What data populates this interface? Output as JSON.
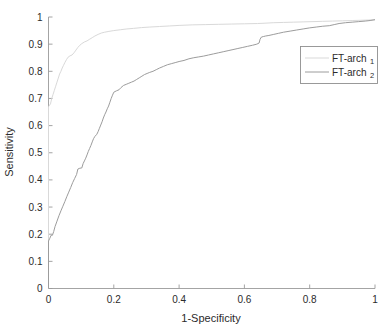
{
  "chart_data": {
    "type": "line",
    "title": "",
    "subtitle": "",
    "xlabel": "1-Specificity",
    "ylabel": "Sensitivity",
    "xlim": [
      0,
      1
    ],
    "ylim": [
      0,
      1
    ],
    "grid": false,
    "legend_position": "right",
    "x_ticks": [
      "0",
      "0.2",
      "0.4",
      "0.6",
      "0.8",
      "1"
    ],
    "x_tick_values": [
      0,
      0.2,
      0.4,
      0.6,
      0.8,
      1
    ],
    "y_ticks": [
      "0",
      "0.1",
      "0.2",
      "0.3",
      "0.4",
      "0.5",
      "0.6",
      "0.7",
      "0.8",
      "0.9",
      "1"
    ],
    "y_tick_values": [
      0,
      0.1,
      0.2,
      0.3,
      0.4,
      0.5,
      0.6,
      0.7,
      0.8,
      0.9,
      1
    ],
    "series": [
      {
        "name": "FT-arch",
        "subscript": "1",
        "color": "#d9d9d9",
        "points": [
          [
            0.0,
            0.0
          ],
          [
            0.0,
            0.67
          ],
          [
            0.006,
            0.68
          ],
          [
            0.01,
            0.7
          ],
          [
            0.014,
            0.715
          ],
          [
            0.018,
            0.73
          ],
          [
            0.022,
            0.745
          ],
          [
            0.026,
            0.76
          ],
          [
            0.03,
            0.775
          ],
          [
            0.034,
            0.79
          ],
          [
            0.038,
            0.8
          ],
          [
            0.042,
            0.812
          ],
          [
            0.046,
            0.822
          ],
          [
            0.05,
            0.832
          ],
          [
            0.055,
            0.843
          ],
          [
            0.06,
            0.852
          ],
          [
            0.066,
            0.857
          ],
          [
            0.072,
            0.86
          ],
          [
            0.078,
            0.868
          ],
          [
            0.084,
            0.878
          ],
          [
            0.09,
            0.888
          ],
          [
            0.096,
            0.896
          ],
          [
            0.102,
            0.902
          ],
          [
            0.11,
            0.908
          ],
          [
            0.118,
            0.912
          ],
          [
            0.126,
            0.918
          ],
          [
            0.134,
            0.924
          ],
          [
            0.142,
            0.93
          ],
          [
            0.152,
            0.936
          ],
          [
            0.162,
            0.941
          ],
          [
            0.172,
            0.944
          ],
          [
            0.185,
            0.947
          ],
          [
            0.2,
            0.95
          ],
          [
            0.22,
            0.953
          ],
          [
            0.24,
            0.956
          ],
          [
            0.26,
            0.958
          ],
          [
            0.285,
            0.961
          ],
          [
            0.31,
            0.963
          ],
          [
            0.34,
            0.965
          ],
          [
            0.37,
            0.967
          ],
          [
            0.4,
            0.969
          ],
          [
            0.44,
            0.971
          ],
          [
            0.48,
            0.972
          ],
          [
            0.52,
            0.973
          ],
          [
            0.56,
            0.974
          ],
          [
            0.6,
            0.975
          ],
          [
            0.64,
            0.976
          ],
          [
            0.66,
            0.977
          ],
          [
            0.69,
            0.979
          ],
          [
            0.72,
            0.98
          ],
          [
            0.75,
            0.981
          ],
          [
            0.78,
            0.982
          ],
          [
            0.81,
            0.983
          ],
          [
            0.84,
            0.984
          ],
          [
            0.87,
            0.985
          ],
          [
            0.9,
            0.986
          ],
          [
            0.93,
            0.987
          ],
          [
            0.96,
            0.988
          ],
          [
            0.98,
            0.989
          ],
          [
            1.0,
            0.99
          ]
        ]
      },
      {
        "name": "FT-arch",
        "subscript": "2",
        "color": "#9c9c9c",
        "points": [
          [
            0.0,
            0.0
          ],
          [
            0.0,
            0.175
          ],
          [
            0.004,
            0.185
          ],
          [
            0.008,
            0.196
          ],
          [
            0.012,
            0.196
          ],
          [
            0.016,
            0.21
          ],
          [
            0.02,
            0.228
          ],
          [
            0.026,
            0.248
          ],
          [
            0.032,
            0.268
          ],
          [
            0.038,
            0.286
          ],
          [
            0.044,
            0.303
          ],
          [
            0.05,
            0.32
          ],
          [
            0.056,
            0.338
          ],
          [
            0.062,
            0.355
          ],
          [
            0.068,
            0.372
          ],
          [
            0.074,
            0.39
          ],
          [
            0.08,
            0.405
          ],
          [
            0.086,
            0.42
          ],
          [
            0.09,
            0.44
          ],
          [
            0.096,
            0.443
          ],
          [
            0.102,
            0.444
          ],
          [
            0.106,
            0.46
          ],
          [
            0.11,
            0.47
          ],
          [
            0.114,
            0.48
          ],
          [
            0.118,
            0.492
          ],
          [
            0.122,
            0.505
          ],
          [
            0.126,
            0.516
          ],
          [
            0.13,
            0.527
          ],
          [
            0.134,
            0.54
          ],
          [
            0.138,
            0.552
          ],
          [
            0.142,
            0.56
          ],
          [
            0.148,
            0.568
          ],
          [
            0.152,
            0.578
          ],
          [
            0.156,
            0.59
          ],
          [
            0.16,
            0.602
          ],
          [
            0.164,
            0.614
          ],
          [
            0.168,
            0.628
          ],
          [
            0.172,
            0.64
          ],
          [
            0.176,
            0.65
          ],
          [
            0.18,
            0.662
          ],
          [
            0.184,
            0.672
          ],
          [
            0.188,
            0.686
          ],
          [
            0.192,
            0.7
          ],
          [
            0.196,
            0.712
          ],
          [
            0.2,
            0.723
          ],
          [
            0.208,
            0.728
          ],
          [
            0.216,
            0.732
          ],
          [
            0.222,
            0.74
          ],
          [
            0.23,
            0.748
          ],
          [
            0.238,
            0.752
          ],
          [
            0.246,
            0.756
          ],
          [
            0.254,
            0.76
          ],
          [
            0.262,
            0.764
          ],
          [
            0.27,
            0.77
          ],
          [
            0.278,
            0.776
          ],
          [
            0.286,
            0.782
          ],
          [
            0.294,
            0.788
          ],
          [
            0.302,
            0.792
          ],
          [
            0.31,
            0.796
          ],
          [
            0.32,
            0.8
          ],
          [
            0.33,
            0.806
          ],
          [
            0.34,
            0.812
          ],
          [
            0.352,
            0.818
          ],
          [
            0.364,
            0.824
          ],
          [
            0.376,
            0.828
          ],
          [
            0.388,
            0.832
          ],
          [
            0.4,
            0.836
          ],
          [
            0.415,
            0.84
          ],
          [
            0.43,
            0.846
          ],
          [
            0.445,
            0.85
          ],
          [
            0.46,
            0.853
          ],
          [
            0.475,
            0.856
          ],
          [
            0.49,
            0.86
          ],
          [
            0.505,
            0.864
          ],
          [
            0.52,
            0.868
          ],
          [
            0.535,
            0.872
          ],
          [
            0.55,
            0.876
          ],
          [
            0.565,
            0.88
          ],
          [
            0.58,
            0.884
          ],
          [
            0.595,
            0.888
          ],
          [
            0.61,
            0.892
          ],
          [
            0.625,
            0.896
          ],
          [
            0.638,
            0.9
          ],
          [
            0.645,
            0.904
          ],
          [
            0.648,
            0.918
          ],
          [
            0.652,
            0.926
          ],
          [
            0.658,
            0.928
          ],
          [
            0.665,
            0.93
          ],
          [
            0.675,
            0.932
          ],
          [
            0.69,
            0.936
          ],
          [
            0.705,
            0.94
          ],
          [
            0.72,
            0.944
          ],
          [
            0.74,
            0.948
          ],
          [
            0.76,
            0.952
          ],
          [
            0.78,
            0.956
          ],
          [
            0.8,
            0.96
          ],
          [
            0.82,
            0.963
          ],
          [
            0.84,
            0.966
          ],
          [
            0.86,
            0.968
          ],
          [
            0.875,
            0.972
          ],
          [
            0.89,
            0.976
          ],
          [
            0.91,
            0.979
          ],
          [
            0.93,
            0.981
          ],
          [
            0.95,
            0.983
          ],
          [
            0.97,
            0.985
          ],
          [
            0.985,
            0.987
          ],
          [
            1.0,
            0.99
          ]
        ]
      }
    ]
  },
  "axes": {
    "x_title": "1-Specificity",
    "y_title": "Sensitivity"
  },
  "legend": {
    "entries": [
      {
        "label": "FT-arch",
        "subscript": "1"
      },
      {
        "label": "FT-arch",
        "subscript": "2"
      }
    ]
  }
}
